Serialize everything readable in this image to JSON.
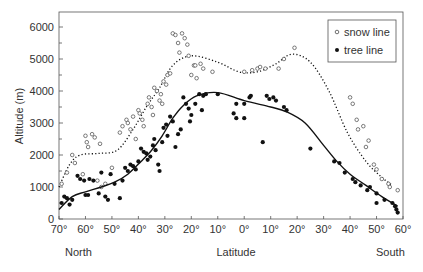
{
  "chart_data": {
    "type": "scatter",
    "title": "",
    "xlabel": "Latitude",
    "ylabel": "Altitude (m)",
    "x_side_labels": {
      "left": "North",
      "right": "South"
    },
    "x_ticks": [
      "70°",
      "60°",
      "50°",
      "40°",
      "30°",
      "20°",
      "10°",
      "0°",
      "10°",
      "20°",
      "30°",
      "40°",
      "50°",
      "60°"
    ],
    "x_note": "x positions are latitude steps from 70°N (0) through 0° (7) to 60°S (13)",
    "y_ticks": [
      0,
      1000,
      2000,
      3000,
      4000,
      5000,
      6000
    ],
    "ylim": [
      0,
      6500
    ],
    "grid": false,
    "legend_position": "top-right",
    "series": [
      {
        "name": "snow line",
        "marker": "open-circle",
        "trend_style": "dotted",
        "trend": [
          [
            0,
            1000
          ],
          [
            0.4,
            1700
          ],
          [
            0.8,
            2000
          ],
          [
            1.5,
            2050
          ],
          [
            2.2,
            2150
          ],
          [
            2.8,
            2800
          ],
          [
            3.3,
            3500
          ],
          [
            3.8,
            4100
          ],
          [
            4.3,
            4800
          ],
          [
            5,
            5100
          ],
          [
            6,
            4900
          ],
          [
            6.8,
            4600
          ],
          [
            7.5,
            4600
          ],
          [
            8.2,
            4850
          ],
          [
            8.8,
            5150
          ],
          [
            9.5,
            4900
          ],
          [
            10.2,
            4000
          ],
          [
            10.9,
            2700
          ],
          [
            11.6,
            1800
          ],
          [
            12.2,
            1300
          ],
          [
            12.6,
            1050
          ]
        ],
        "points": [
          [
            0.1,
            1100
          ],
          [
            0.3,
            1450
          ],
          [
            0.5,
            2000
          ],
          [
            0.6,
            1750
          ],
          [
            0.9,
            1400
          ],
          [
            1,
            2600
          ],
          [
            1.05,
            2400
          ],
          [
            1.1,
            2250
          ],
          [
            1.25,
            2650
          ],
          [
            1.35,
            2550
          ],
          [
            1.55,
            2350
          ],
          [
            1.45,
            1200
          ],
          [
            1.75,
            1100
          ],
          [
            1.6,
            1000
          ],
          [
            2.0,
            1600
          ],
          [
            2.3,
            2700
          ],
          [
            2.4,
            2900
          ],
          [
            2.55,
            3100
          ],
          [
            2.6,
            3000
          ],
          [
            2.7,
            2800
          ],
          [
            2.8,
            3200
          ],
          [
            2.9,
            2500
          ],
          [
            3.0,
            3400
          ],
          [
            3.05,
            3300
          ],
          [
            3.15,
            3100
          ],
          [
            3.2,
            2900
          ],
          [
            3.35,
            3600
          ],
          [
            3.4,
            3800
          ],
          [
            3.5,
            3500
          ],
          [
            3.55,
            3250
          ],
          [
            3.6,
            4100
          ],
          [
            3.7,
            4000
          ],
          [
            3.8,
            3700
          ],
          [
            3.85,
            3900
          ],
          [
            3.9,
            3600
          ],
          [
            3.95,
            4300
          ],
          [
            4.05,
            4200
          ],
          [
            4.1,
            4500
          ],
          [
            4.2,
            4550
          ],
          [
            4.3,
            5800
          ],
          [
            4.4,
            5750
          ],
          [
            4.5,
            5500
          ],
          [
            4.55,
            5200
          ],
          [
            4.65,
            5800
          ],
          [
            4.75,
            5650
          ],
          [
            4.85,
            5450
          ],
          [
            4.9,
            5100
          ],
          [
            5.0,
            4500
          ],
          [
            5.1,
            4800
          ],
          [
            5.15,
            4800
          ],
          [
            5.2,
            4400
          ],
          [
            5.35,
            4850
          ],
          [
            5.45,
            4700
          ],
          [
            5.8,
            4600
          ],
          [
            7.0,
            4600
          ],
          [
            7.3,
            4650
          ],
          [
            7.5,
            4700
          ],
          [
            7.6,
            4750
          ],
          [
            7.8,
            4700
          ],
          [
            8.3,
            4700
          ],
          [
            8.5,
            5000
          ],
          [
            8.9,
            5350
          ],
          [
            11.0,
            3800
          ],
          [
            11.1,
            3600
          ],
          [
            11.25,
            3100
          ],
          [
            11.3,
            2800
          ],
          [
            11.5,
            2900
          ],
          [
            11.6,
            2250
          ],
          [
            11.7,
            2450
          ],
          [
            11.9,
            1700
          ],
          [
            12.0,
            1550
          ],
          [
            12.2,
            1250
          ],
          [
            12.45,
            1100
          ],
          [
            12.5,
            1000
          ],
          [
            12.8,
            900
          ]
        ]
      },
      {
        "name": "tree line",
        "marker": "filled-circle",
        "trend_style": "solid",
        "trend": [
          [
            0,
            300
          ],
          [
            0.5,
            700
          ],
          [
            1,
            850
          ],
          [
            1.6,
            1000
          ],
          [
            2.1,
            1150
          ],
          [
            2.6,
            1400
          ],
          [
            3.1,
            1800
          ],
          [
            3.5,
            2150
          ],
          [
            3.9,
            2600
          ],
          [
            4.3,
            3150
          ],
          [
            4.7,
            3550
          ],
          [
            5.2,
            3850
          ],
          [
            6,
            3950
          ],
          [
            7,
            3700
          ],
          [
            8,
            3500
          ],
          [
            8.6,
            3350
          ],
          [
            9.3,
            3000
          ],
          [
            10,
            2300
          ],
          [
            10.5,
            1800
          ],
          [
            11,
            1400
          ],
          [
            11.6,
            1050
          ],
          [
            12.2,
            700
          ],
          [
            12.8,
            400
          ]
        ],
        "points": [
          [
            0.1,
            500
          ],
          [
            0.2,
            700
          ],
          [
            0.3,
            650
          ],
          [
            0.4,
            450
          ],
          [
            0.5,
            600
          ],
          [
            0.7,
            1350
          ],
          [
            0.8,
            1250
          ],
          [
            0.95,
            1200
          ],
          [
            1,
            750
          ],
          [
            1.1,
            750
          ],
          [
            1.15,
            1250
          ],
          [
            1.3,
            1200
          ],
          [
            1.5,
            800
          ],
          [
            1.6,
            1450
          ],
          [
            1.75,
            700
          ],
          [
            1.85,
            600
          ],
          [
            1.95,
            1400
          ],
          [
            2.1,
            1100
          ],
          [
            2.3,
            650
          ],
          [
            2.4,
            1200
          ],
          [
            2.5,
            1600
          ],
          [
            2.6,
            1500
          ],
          [
            2.7,
            1700
          ],
          [
            2.8,
            1650
          ],
          [
            2.9,
            1550
          ],
          [
            3.0,
            1800
          ],
          [
            3.1,
            2200
          ],
          [
            3.2,
            2100
          ],
          [
            3.3,
            2050
          ],
          [
            3.35,
            1850
          ],
          [
            3.45,
            1950
          ],
          [
            3.55,
            2300
          ],
          [
            3.6,
            2500
          ],
          [
            3.65,
            2150
          ],
          [
            3.75,
            1700
          ],
          [
            3.8,
            1500
          ],
          [
            3.9,
            2400
          ],
          [
            3.95,
            2850
          ],
          [
            4.05,
            2950
          ],
          [
            4.1,
            2600
          ],
          [
            4.2,
            3200
          ],
          [
            4.3,
            3050
          ],
          [
            4.4,
            2250
          ],
          [
            4.5,
            2650
          ],
          [
            4.6,
            2800
          ],
          [
            4.7,
            3800
          ],
          [
            4.8,
            3600
          ],
          [
            4.9,
            3450
          ],
          [
            4.95,
            3050
          ],
          [
            5.0,
            3250
          ],
          [
            5.15,
            3600
          ],
          [
            5.3,
            3900
          ],
          [
            5.45,
            3850
          ],
          [
            5.55,
            3900
          ],
          [
            5.4,
            3400
          ],
          [
            6.0,
            3900
          ],
          [
            6.6,
            3300
          ],
          [
            6.7,
            3150
          ],
          [
            6.7,
            3600
          ],
          [
            7.0,
            3600
          ],
          [
            7.2,
            3800
          ],
          [
            7.25,
            3850
          ],
          [
            7.0,
            3150
          ],
          [
            7.7,
            2400
          ],
          [
            7.85,
            3850
          ],
          [
            7.95,
            3750
          ],
          [
            8.1,
            3800
          ],
          [
            8.2,
            3700
          ],
          [
            8.5,
            3500
          ],
          [
            8.6,
            3400
          ],
          [
            9.5,
            2200
          ],
          [
            10.4,
            1800
          ],
          [
            10.6,
            1750
          ],
          [
            10.8,
            1450
          ],
          [
            11.1,
            1250
          ],
          [
            11.2,
            1150
          ],
          [
            11.4,
            1050
          ],
          [
            11.65,
            900
          ],
          [
            11.75,
            1000
          ],
          [
            12.0,
            800
          ],
          [
            12.0,
            500
          ],
          [
            12.3,
            600
          ],
          [
            12.6,
            500
          ],
          [
            12.7,
            400
          ],
          [
            12.75,
            300
          ],
          [
            12.8,
            200
          ]
        ]
      }
    ]
  }
}
